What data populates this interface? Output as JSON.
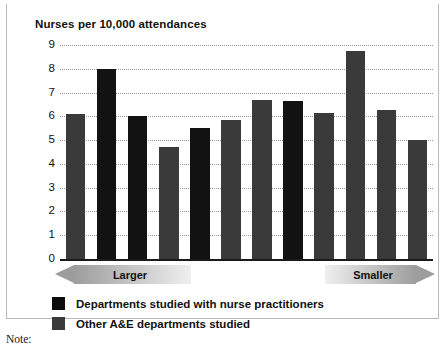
{
  "chart_data": {
    "type": "bar",
    "title": "Nurses per 10,000 attendances",
    "xlabel": "",
    "ylabel": "",
    "ylim": [
      0,
      9
    ],
    "yticks": [
      9,
      8,
      7,
      6,
      5,
      4,
      3,
      2,
      1,
      0
    ],
    "grid": true,
    "legend_position": "below",
    "categories": [
      "1",
      "2",
      "3",
      "4",
      "5",
      "6",
      "7",
      "8",
      "9",
      "10",
      "11",
      "12"
    ],
    "bars": [
      {
        "index": 1,
        "value": 6.1,
        "series": "Other A&E departments studied"
      },
      {
        "index": 2,
        "value": 8.0,
        "series": "Departments studied with nurse practitioners"
      },
      {
        "index": 3,
        "value": 6.0,
        "series": "Departments studied with nurse practitioners"
      },
      {
        "index": 4,
        "value": 4.7,
        "series": "Other A&E departments studied"
      },
      {
        "index": 5,
        "value": 5.5,
        "series": "Departments studied with nurse practitioners"
      },
      {
        "index": 6,
        "value": 5.85,
        "series": "Other A&E departments studied"
      },
      {
        "index": 7,
        "value": 6.7,
        "series": "Other A&E departments studied"
      },
      {
        "index": 8,
        "value": 6.65,
        "series": "Departments studied with nurse practitioners"
      },
      {
        "index": 9,
        "value": 6.15,
        "series": "Other A&E departments studied"
      },
      {
        "index": 10,
        "value": 8.75,
        "series": "Other A&E departments studied"
      },
      {
        "index": 11,
        "value": 6.25,
        "series": "Other A&E departments studied"
      },
      {
        "index": 12,
        "value": 5.0,
        "series": "Other A&E departments studied"
      }
    ],
    "series": [
      {
        "name": "Departments studied with nurse practitioners",
        "color": "#121212"
      },
      {
        "name": "Other A&E departments studied",
        "color": "#3a3a3a"
      }
    ],
    "annotations": [
      {
        "text": "Larger",
        "position": "bottom-left",
        "shape": "left-arrow"
      },
      {
        "text": "Smaller",
        "position": "bottom-right",
        "shape": "right-arrow"
      }
    ]
  },
  "legend": {
    "items": [
      {
        "label": "Departments studied with nurse practitioners",
        "color": "#0d0d0d"
      },
      {
        "label": "Other A&E departments studied",
        "color": "#3a3a3a"
      }
    ]
  },
  "axis_banners": {
    "left_label": "Larger",
    "right_label": "Smaller"
  },
  "footer": {
    "note_label": "Note:"
  }
}
